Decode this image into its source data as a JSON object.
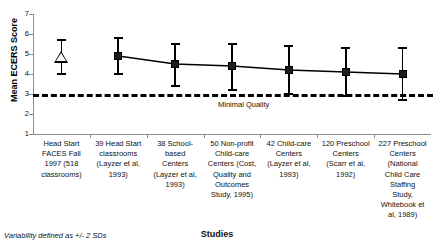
{
  "chart_data": {
    "type": "line",
    "title": "",
    "xlabel": "Studies",
    "ylabel": "Mean ECERS Score",
    "ylim": [
      1,
      7
    ],
    "yticks": [
      1,
      2,
      3,
      4,
      5,
      6,
      7
    ],
    "ytick_labels": [
      "1",
      "2",
      "3",
      "4",
      "5",
      "6",
      "7"
    ],
    "grid": false,
    "legend": "none",
    "categories": [
      "Head Start FACES Fall 1997 (518 classrooms)",
      "39 Head Start classrooms (Layzer et al, 1993)",
      "38 School-based Centers (Layzer et al, 1993)",
      "50 Non-profit Child-care Centers (Cost, Quality and Outcomes Study, 1995)",
      "42 Child-care Centers (Layzer et al, 1993)",
      "120 Preschool Centers (Scarr et al, 1992)",
      "227 Preschool Centers (National Child Care Staffing Study, Whitebook et al, 1989)"
    ],
    "category_lines": [
      [
        "Head Start",
        "FACES Fall",
        "1997 (518",
        "classrooms)"
      ],
      [
        "39 Head Start",
        "classrooms",
        "(Layzer et al,",
        "1993)"
      ],
      [
        "38 School-",
        "based",
        "Centers",
        "(Layzer et al,",
        "1993)"
      ],
      [
        "50 Non-profit",
        "Child-care",
        "Centers (Cost,",
        "Quality and",
        "Outcomes",
        "Study, 1995)"
      ],
      [
        "42 Child-care",
        "Centers",
        "(Layzer et al,",
        "1993)"
      ],
      [
        "120 Preschool",
        "Centers",
        "(Scarr et al,",
        "1992)"
      ],
      [
        "227 Preschool",
        "Centers",
        "(National",
        "Child Care",
        "Staffing",
        "Study,",
        "Whitebook et",
        "al, 1989)"
      ]
    ],
    "values": [
      4.8,
      4.9,
      4.5,
      4.4,
      4.2,
      4.1,
      4.0
    ],
    "err_low": [
      4.0,
      4.0,
      3.4,
      3.2,
      3.0,
      2.9,
      2.7
    ],
    "err_high": [
      5.7,
      5.8,
      5.5,
      5.5,
      5.4,
      5.3,
      5.3
    ],
    "markers": [
      "triangle-open",
      "square-filled",
      "square-filled",
      "square-filled",
      "square-filled",
      "square-filled",
      "square-filled"
    ],
    "connected_from_index": 1,
    "threshold": {
      "value": 3.0,
      "label": "Minimal Quality",
      "style": "dashed"
    },
    "annotations": {
      "footnote": "Variability defined as +/- 2 SDs"
    },
    "colors": {
      "marker": "#1c1c1c",
      "line": "#000000",
      "axis": "#8c8c8c",
      "threshold": "#000000",
      "text": "#111111",
      "background": "#ffffff"
    }
  }
}
